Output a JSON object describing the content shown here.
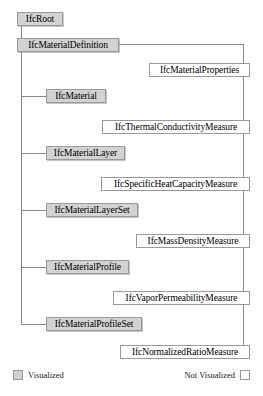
{
  "diagram": {
    "colors": {
      "visualized_fill": "#d2d2d2",
      "not_visualized_fill": "#ffffff",
      "box_border": "#9a9a9a",
      "connector_line": "#8a8a8a",
      "background": "#ffffff",
      "text": "#000000"
    },
    "nodes": [
      {
        "id": "ifc-root",
        "label": "IfcRoot",
        "style": "visualized",
        "x": 17,
        "y": 12,
        "w": 46
      },
      {
        "id": "ifc-material-definition",
        "label": "IfcMaterialDefinition",
        "style": "visualized",
        "x": 17,
        "y": 38,
        "w": 102
      },
      {
        "id": "ifc-material-properties",
        "label": "IfcMaterialProperties",
        "style": "not-visualized",
        "x": 149,
        "y": 63,
        "w": 101
      },
      {
        "id": "ifc-material",
        "label": "IfcMaterial",
        "style": "visualized",
        "x": 46,
        "y": 89,
        "w": 60
      },
      {
        "id": "ifc-thermal-conductivity-measure",
        "label": "IfcThermalConductivityMeasure",
        "style": "not-visualized",
        "x": 102,
        "y": 120,
        "w": 148
      },
      {
        "id": "ifc-material-layer",
        "label": "IfcMaterialLayer",
        "style": "visualized",
        "x": 46,
        "y": 146,
        "w": 79
      },
      {
        "id": "ifc-specific-heat-capacity-measure",
        "label": "IfcSpecificHeatCapacityMeasure",
        "style": "not-visualized",
        "x": 101,
        "y": 177,
        "w": 149
      },
      {
        "id": "ifc-material-layer-set",
        "label": "IfcMaterialLayerSet",
        "style": "visualized",
        "x": 46,
        "y": 203,
        "w": 92
      },
      {
        "id": "ifc-mass-density-measure",
        "label": "IfcMassDensityMeasure",
        "style": "not-visualized",
        "x": 136,
        "y": 234,
        "w": 114
      },
      {
        "id": "ifc-material-profile",
        "label": "IfcMaterialProfile",
        "style": "visualized",
        "x": 46,
        "y": 260,
        "w": 83
      },
      {
        "id": "ifc-vapor-permeability-measure",
        "label": "IfcVaporPermeabilityMeasure",
        "style": "not-visualized",
        "x": 113,
        "y": 291,
        "w": 137
      },
      {
        "id": "ifc-material-profile-set",
        "label": "IfcMaterialProfileSet",
        "style": "visualized",
        "x": 46,
        "y": 317,
        "w": 96
      },
      {
        "id": "ifc-normalized-ratio-measure",
        "label": "IfcNormalizedRatioMeasure",
        "style": "not-visualized",
        "x": 120,
        "y": 345,
        "w": 130
      }
    ],
    "legend": {
      "visualized_label": "Visualized",
      "not_visualized_label": "Not Visualized"
    }
  }
}
